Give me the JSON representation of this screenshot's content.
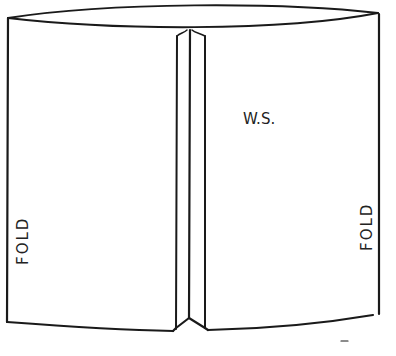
{
  "diagram": {
    "type": "sewing-construction-sketch",
    "labels": {
      "fold_left": "FOLD",
      "fold_right": "FOLD",
      "wrong_side": "W.S."
    },
    "colors": {
      "line": "#1a1a1a",
      "background": "#ffffff"
    }
  }
}
